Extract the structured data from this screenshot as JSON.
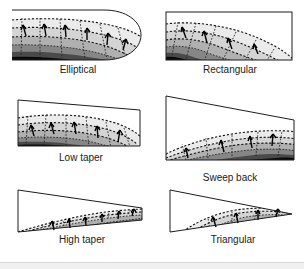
{
  "figure": {
    "background_color": "#ffffff",
    "grid": {
      "rows": 3,
      "columns": 2
    },
    "line_color": "#1d1d1d",
    "contour_color": "#111111",
    "vector_color": "#000000",
    "shade_levels": [
      "#ffffff",
      "#e8e8e8",
      "#d2d2d2",
      "#b4b4b4",
      "#8f8f8f",
      "#5e5e5e",
      "#2a2a2a",
      "#000000"
    ]
  },
  "panels": [
    {
      "id": "elliptical",
      "label": "Elliptical",
      "shape": "elliptical-planform",
      "row": 1,
      "column": 1,
      "has_outline": true,
      "outline_style": "curved-elliptical-tip",
      "contour_count": 4,
      "vector_count": 6
    },
    {
      "id": "rectangular",
      "label": "Rectangular",
      "shape": "rectangular-planform",
      "row": 1,
      "column": 2,
      "has_outline": true,
      "outline_style": "rectangle",
      "contour_count": 4,
      "vector_count": 4
    },
    {
      "id": "low-taper",
      "label": "Low taper",
      "shape": "low-taper-planform",
      "row": 2,
      "column": 1,
      "has_outline": true,
      "outline_style": "slightly-tapered-quadrilateral",
      "contour_count": 4,
      "vector_count": 5
    },
    {
      "id": "sweep-back",
      "label": "Sweep back",
      "shape": "swept-back-planform",
      "row": 2,
      "column": 2,
      "has_outline": true,
      "outline_style": "swept-quadrilateral",
      "contour_count": 4,
      "vector_count": 4
    },
    {
      "id": "high-taper",
      "label": "High taper",
      "shape": "high-taper-planform",
      "row": 3,
      "column": 1,
      "has_outline": true,
      "outline_style": "strongly-tapered-quadrilateral",
      "contour_count": 4,
      "vector_count": 6
    },
    {
      "id": "triangular",
      "label": "Triangular",
      "shape": "triangular-planform",
      "row": 3,
      "column": 2,
      "has_outline": true,
      "outline_style": "triangle",
      "contour_count": 4,
      "vector_count": 4
    }
  ]
}
